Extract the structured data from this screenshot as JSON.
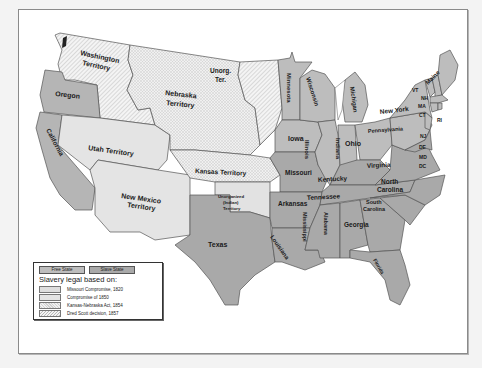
{
  "map": {
    "colors": {
      "background": "#f3f3f3",
      "frame": "#ffffff",
      "free_state": "#bdbdbd",
      "slave_state": "#a9a9a9",
      "missouri_compromise": "#dedede",
      "compromise_1850": "#e6e6e6",
      "kansas_nebraska": "#efefef",
      "dred_scott": "#f2f2f2",
      "border": "#555555"
    },
    "regions": [
      {
        "name": "Washington Territory",
        "type": "Dred Scott decision, 1857"
      },
      {
        "name": "Oregon",
        "type": "Free State"
      },
      {
        "name": "California",
        "type": "Free State"
      },
      {
        "name": "Utah Territory",
        "type": "Compromise of 1850"
      },
      {
        "name": "New Mexico Territory",
        "type": "Compromise of 1850"
      },
      {
        "name": "Nebraska Territory",
        "type": "Kansas-Nebraska Act, 1854"
      },
      {
        "name": "Unorg. Ter.",
        "type": "Dred Scott decision, 1857"
      },
      {
        "name": "Kansas Territory",
        "type": "Kansas-Nebraska Act, 1854"
      },
      {
        "name": "Unorganized (Indian) Territory",
        "type": "Missouri Compromise, 1820"
      },
      {
        "name": "Texas",
        "type": "Slave State"
      },
      {
        "name": "Minnesota",
        "type": "Free State"
      },
      {
        "name": "Iowa",
        "type": "Free State"
      },
      {
        "name": "Missouri",
        "type": "Slave State"
      },
      {
        "name": "Arkansas",
        "type": "Slave State"
      },
      {
        "name": "Louisiana",
        "type": "Slave State"
      },
      {
        "name": "Wisconsin",
        "type": "Free State"
      },
      {
        "name": "Illinois",
        "type": "Free State"
      },
      {
        "name": "Michigan",
        "type": "Free State"
      },
      {
        "name": "Indiana",
        "type": "Free State"
      },
      {
        "name": "Ohio",
        "type": "Free State"
      },
      {
        "name": "Kentucky",
        "type": "Slave State"
      },
      {
        "name": "Tennessee",
        "type": "Slave State"
      },
      {
        "name": "Mississippi",
        "type": "Slave State"
      },
      {
        "name": "Alabama",
        "type": "Slave State"
      },
      {
        "name": "Georgia",
        "type": "Slave State"
      },
      {
        "name": "Florida",
        "type": "Slave State"
      },
      {
        "name": "South Carolina",
        "type": "Slave State"
      },
      {
        "name": "North Carolina",
        "type": "Slave State"
      },
      {
        "name": "Virginia",
        "type": "Slave State"
      },
      {
        "name": "Pennsylvania",
        "type": "Free State"
      },
      {
        "name": "New York",
        "type": "Free State"
      },
      {
        "name": "VT",
        "type": "Free State"
      },
      {
        "name": "NH",
        "type": "Free State"
      },
      {
        "name": "Maine",
        "type": "Free State"
      },
      {
        "name": "MA",
        "type": "Free State"
      },
      {
        "name": "CT",
        "type": "Free State"
      },
      {
        "name": "RI",
        "type": "Free State"
      },
      {
        "name": "NJ",
        "type": "Free State"
      },
      {
        "name": "DE",
        "type": "Slave State"
      },
      {
        "name": "MD",
        "type": "Slave State"
      },
      {
        "name": "DC",
        "type": "Slave State"
      }
    ],
    "labels": {
      "washington": [
        "Washington",
        "Territory"
      ],
      "oregon": "Oregon",
      "california": "California",
      "utah": "Utah Territory",
      "new_mexico": [
        "New Mexico",
        "Territory"
      ],
      "nebraska": [
        "Nebraska",
        "Territory"
      ],
      "unorg": [
        "Unorg.",
        "Ter."
      ],
      "kansas": "Kansas Territory",
      "indian": [
        "Unorganized",
        "(Indian)",
        "Territory"
      ],
      "texas": "Texas",
      "minnesota": "Minnesota",
      "iowa": "Iowa",
      "missouri": "Missouri",
      "arkansas": "Arkansas",
      "louisiana": "Louisiana",
      "wisconsin": "Wisconsin",
      "illinois": "Illinois",
      "michigan": "Michigan",
      "indiana": "Indiana",
      "ohio": "Ohio",
      "kentucky": "Kentucky",
      "tennessee": "Tennessee",
      "mississippi": "Mississippi",
      "alabama": "Alabama",
      "georgia": "Georgia",
      "florida": "Florida",
      "south_carolina": [
        "South",
        "Carolina"
      ],
      "north_carolina": [
        "North",
        "Carolina"
      ],
      "virginia": "Virginia",
      "pennsylvania": "Pennsylvania",
      "new_york": "New York",
      "vt": "VT",
      "nh": "NH",
      "maine": "Maine",
      "ma": "MA",
      "ct": "CT",
      "ri": "RI",
      "nj": "NJ",
      "de": "DE",
      "md": "MD",
      "dc": "DC"
    }
  },
  "legend": {
    "keys": [
      "Free State",
      "Slave State"
    ],
    "title": "Slavery legal based on:",
    "items": [
      "Missouri Compromise, 1820",
      "Compromise of 1850",
      "Kansas-Nebraska Act, 1854",
      "Dred Scott decision, 1857"
    ]
  }
}
